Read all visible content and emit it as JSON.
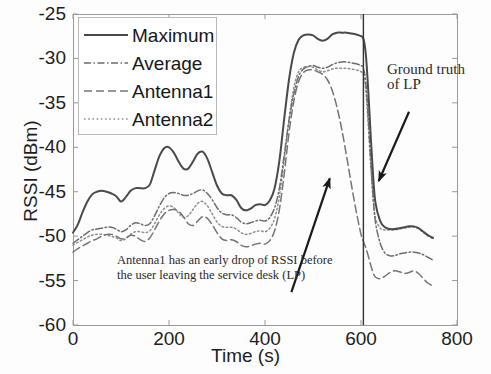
{
  "figure": {
    "background": "#fdfdfd",
    "axes_color": "#9a9a9a"
  },
  "chart_data": {
    "type": "line",
    "title": "",
    "xlabel": "Time (s)",
    "ylabel": "RSSI (dBm)",
    "xlim": [
      0,
      800
    ],
    "ylim": [
      -60,
      -25
    ],
    "xticks": [
      0,
      200,
      400,
      600,
      800
    ],
    "yticks": [
      -25,
      -30,
      -35,
      -40,
      -45,
      -50,
      -55,
      -60
    ],
    "grid": false,
    "legend_position": "upper-left",
    "series": [
      {
        "name": "Maximum",
        "style": "solid",
        "color": "#4a4a4a",
        "width": 2.0,
        "x": [
          0,
          10,
          20,
          30,
          40,
          50,
          60,
          70,
          80,
          90,
          100,
          110,
          120,
          130,
          140,
          150,
          160,
          170,
          180,
          190,
          200,
          210,
          220,
          230,
          240,
          250,
          260,
          270,
          280,
          290,
          300,
          310,
          320,
          330,
          340,
          350,
          360,
          370,
          380,
          390,
          400,
          410,
          420,
          430,
          440,
          450,
          460,
          470,
          480,
          490,
          500,
          510,
          520,
          530,
          540,
          550,
          560,
          570,
          580,
          590,
          600,
          605,
          610,
          615,
          620,
          625,
          630,
          640,
          650,
          660,
          670,
          680,
          690,
          700,
          710,
          720,
          730,
          740,
          750
        ],
        "y": [
          -49.6,
          -48.7,
          -47.3,
          -46.1,
          -45.3,
          -45.0,
          -44.9,
          -45.0,
          -45.2,
          -45.5,
          -46.1,
          -45.6,
          -44.9,
          -44.6,
          -44.6,
          -44.6,
          -44.2,
          -42.6,
          -41.0,
          -40.1,
          -40.0,
          -40.6,
          -41.6,
          -42.4,
          -42.4,
          -41.6,
          -40.7,
          -40.5,
          -41.3,
          -42.8,
          -44.3,
          -45.2,
          -45.4,
          -45.4,
          -45.9,
          -46.8,
          -47.1,
          -46.9,
          -46.5,
          -46.4,
          -46.5,
          -46.0,
          -44.6,
          -41.5,
          -36.8,
          -32.4,
          -29.4,
          -27.9,
          -27.4,
          -27.3,
          -27.4,
          -27.8,
          -28.0,
          -27.8,
          -27.3,
          -27.1,
          -27.1,
          -27.1,
          -27.2,
          -27.3,
          -27.5,
          -27.8,
          -29.5,
          -33.5,
          -38.5,
          -43.0,
          -46.2,
          -48.3,
          -49.0,
          -49.2,
          -49.2,
          -49.1,
          -49.0,
          -48.9,
          -48.9,
          -49.1,
          -49.5,
          -49.9,
          -50.2
        ]
      },
      {
        "name": "Average",
        "style": "dashdot",
        "color": "#6d6d6d",
        "width": 1.5,
        "x": [
          0,
          10,
          20,
          30,
          40,
          50,
          60,
          70,
          80,
          90,
          100,
          110,
          120,
          130,
          140,
          150,
          160,
          170,
          180,
          190,
          200,
          210,
          220,
          230,
          240,
          250,
          260,
          270,
          280,
          290,
          300,
          310,
          320,
          330,
          340,
          350,
          360,
          370,
          380,
          390,
          400,
          410,
          420,
          430,
          440,
          450,
          460,
          470,
          480,
          490,
          500,
          510,
          520,
          530,
          540,
          550,
          560,
          570,
          580,
          590,
          600,
          605,
          610,
          615,
          620,
          625,
          630,
          640,
          650,
          660,
          670,
          680,
          690,
          700,
          710,
          720,
          730,
          740,
          750
        ],
        "y": [
          -50.8,
          -50.4,
          -50.0,
          -49.6,
          -49.3,
          -49.2,
          -49.1,
          -49.0,
          -49.0,
          -49.2,
          -49.5,
          -49.3,
          -48.8,
          -48.5,
          -48.6,
          -48.8,
          -48.6,
          -47.7,
          -46.6,
          -45.7,
          -45.2,
          -45.1,
          -45.2,
          -45.4,
          -45.4,
          -45.2,
          -44.9,
          -44.8,
          -45.2,
          -45.9,
          -46.8,
          -47.4,
          -47.6,
          -47.6,
          -47.9,
          -48.4,
          -48.6,
          -48.5,
          -48.3,
          -48.2,
          -48.3,
          -47.9,
          -46.8,
          -44.6,
          -40.9,
          -37.0,
          -34.0,
          -32.0,
          -31.2,
          -30.9,
          -30.8,
          -31.0,
          -31.1,
          -31.0,
          -30.7,
          -30.5,
          -30.4,
          -30.4,
          -30.5,
          -30.6,
          -30.8,
          -31.1,
          -32.7,
          -36.6,
          -41.3,
          -45.4,
          -48.4,
          -50.8,
          -51.9,
          -52.2,
          -52.2,
          -52.0,
          -51.9,
          -51.8,
          -51.8,
          -51.9,
          -52.1,
          -52.4,
          -52.7
        ]
      },
      {
        "name": "Antenna1",
        "style": "dashed",
        "color": "#757575",
        "width": 1.5,
        "x": [
          0,
          10,
          20,
          30,
          40,
          50,
          60,
          70,
          80,
          90,
          100,
          110,
          120,
          130,
          140,
          150,
          160,
          170,
          180,
          190,
          200,
          210,
          220,
          230,
          240,
          250,
          260,
          270,
          280,
          290,
          300,
          310,
          320,
          330,
          340,
          350,
          360,
          370,
          380,
          390,
          400,
          410,
          420,
          430,
          440,
          450,
          460,
          470,
          480,
          490,
          500,
          510,
          520,
          530,
          540,
          550,
          560,
          570,
          580,
          590,
          600,
          605,
          610,
          615,
          620,
          625,
          630,
          640,
          650,
          660,
          670,
          680,
          690,
          700,
          710,
          720,
          730,
          740,
          750
        ],
        "y": [
          -51.8,
          -51.4,
          -51.1,
          -50.8,
          -50.5,
          -50.3,
          -50.0,
          -49.8,
          -49.8,
          -50.0,
          -50.3,
          -50.2,
          -49.9,
          -50.0,
          -50.4,
          -50.6,
          -50.2,
          -49.3,
          -48.3,
          -47.5,
          -47.1,
          -47.0,
          -47.2,
          -47.8,
          -48.6,
          -48.8,
          -48.3,
          -47.8,
          -48.0,
          -48.7,
          -49.6,
          -50.3,
          -50.5,
          -50.4,
          -50.6,
          -51.0,
          -51.2,
          -51.1,
          -50.9,
          -50.8,
          -50.9,
          -50.5,
          -49.4,
          -47.0,
          -43.0,
          -38.4,
          -34.8,
          -32.6,
          -31.6,
          -31.3,
          -31.3,
          -31.5,
          -31.8,
          -32.4,
          -33.6,
          -35.5,
          -38.0,
          -41.0,
          -44.2,
          -47.2,
          -49.8,
          -50.6,
          -51.3,
          -52.2,
          -53.2,
          -54.1,
          -54.6,
          -54.8,
          -54.5,
          -54.1,
          -53.9,
          -54.0,
          -54.2,
          -54.1,
          -53.9,
          -54.2,
          -54.8,
          -55.3,
          -55.6
        ]
      },
      {
        "name": "Antenna2",
        "style": "dotted",
        "color": "#8e8e8e",
        "width": 1.5,
        "x": [
          0,
          10,
          20,
          30,
          40,
          50,
          60,
          70,
          80,
          90,
          100,
          110,
          120,
          130,
          140,
          150,
          160,
          170,
          180,
          190,
          200,
          210,
          220,
          230,
          240,
          250,
          260,
          270,
          280,
          290,
          300,
          310,
          320,
          330,
          340,
          350,
          360,
          370,
          380,
          390,
          400,
          410,
          420,
          430,
          440,
          450,
          460,
          470,
          480,
          490,
          500,
          510,
          520,
          530,
          540,
          550,
          560,
          570,
          580,
          590,
          600,
          605,
          610,
          615,
          620,
          625,
          630,
          640,
          650,
          660,
          670,
          680,
          690,
          700,
          710,
          720,
          730,
          740,
          750
        ],
        "y": [
          -51.0,
          -50.7,
          -50.4,
          -50.1,
          -49.9,
          -49.8,
          -49.8,
          -49.9,
          -50.0,
          -50.2,
          -50.5,
          -50.3,
          -49.8,
          -49.5,
          -49.5,
          -49.6,
          -49.4,
          -48.6,
          -47.6,
          -46.9,
          -46.6,
          -46.8,
          -47.4,
          -47.9,
          -47.7,
          -47.0,
          -46.3,
          -46.1,
          -46.6,
          -47.5,
          -48.4,
          -48.9,
          -49.0,
          -49.0,
          -49.2,
          -49.6,
          -49.8,
          -49.7,
          -49.5,
          -49.4,
          -49.5,
          -49.1,
          -48.0,
          -45.5,
          -41.4,
          -36.9,
          -33.3,
          -31.5,
          -31.0,
          -30.9,
          -31.0,
          -31.3,
          -31.5,
          -31.4,
          -31.2,
          -31.1,
          -31.1,
          -31.1,
          -31.2,
          -31.3,
          -31.5,
          -31.8,
          -33.5,
          -37.4,
          -41.8,
          -45.6,
          -47.9,
          -49.1,
          -49.3,
          -49.3,
          -49.3,
          -49.2,
          -49.1,
          -49.0,
          -49.0,
          -49.2,
          -49.6,
          -50.0,
          -50.3
        ]
      }
    ],
    "vertical_line": {
      "x": 605,
      "label": "Ground truth of LP",
      "color": "#333333"
    },
    "annotations": [
      {
        "name": "antenna1-note",
        "text": "Antenna1 has an early drop of RSSI before\nthe user leaving the service desk (LP)",
        "arrow_from": [
          455,
          -56.3
        ],
        "arrow_to": [
          535,
          -43.5
        ]
      },
      {
        "name": "ground-truth-note",
        "text": "Ground truth of LP",
        "arrow_from": [
          700,
          -36.0
        ],
        "arrow_to": [
          637,
          -43.8
        ]
      }
    ]
  },
  "axis": {
    "ylabel": "RSSI (dBm)",
    "xlabel": "Time (s)",
    "ytick_labels": [
      "-25",
      "-30",
      "-35",
      "-40",
      "-45",
      "-50",
      "-55",
      "-60"
    ],
    "xtick_labels": [
      "0",
      "200",
      "400",
      "600",
      "800"
    ]
  },
  "legend": {
    "items": [
      {
        "label": "Maximum",
        "style": "solid"
      },
      {
        "label": "Average",
        "style": "dashdot"
      },
      {
        "label": "Antenna1",
        "style": "dashed"
      },
      {
        "label": "Antenna2",
        "style": "dotted"
      }
    ]
  },
  "annotations": {
    "antenna1_note_line1": "Antenna1 has an early drop of RSSI before",
    "antenna1_note_line2": "the user leaving the service desk (LP)",
    "ground_truth_line1": "Ground truth",
    "ground_truth_line2": "of LP"
  }
}
